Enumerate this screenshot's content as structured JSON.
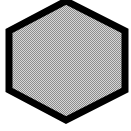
{
  "canvas": {
    "width": 131,
    "height": 131,
    "background_color": "#ffffff",
    "description": "pointy-top hexagon, thick black outline, dithered gray halftone fill"
  },
  "shape": {
    "name": "hexagon",
    "sides": 6,
    "orientation": "pointy-top",
    "outline_color": "#000000",
    "outline_width": 7,
    "fill_color": "#b0b0b0",
    "fill_pattern": "dither-checkerboard",
    "fill_pattern_light": "#d6d6d6",
    "fill_pattern_dark": "#8e8e8e",
    "points": "66,1 125,31 125,90 66,120 9,90 9,31",
    "vertices": [
      {
        "label": "top",
        "x": 66,
        "y": 1
      },
      {
        "label": "upper-right",
        "x": 125,
        "y": 31
      },
      {
        "label": "lower-right",
        "x": 125,
        "y": 90
      },
      {
        "label": "bottom",
        "x": 66,
        "y": 120
      },
      {
        "label": "lower-left",
        "x": 9,
        "y": 90
      },
      {
        "label": "upper-left",
        "x": 9,
        "y": 31
      }
    ]
  }
}
